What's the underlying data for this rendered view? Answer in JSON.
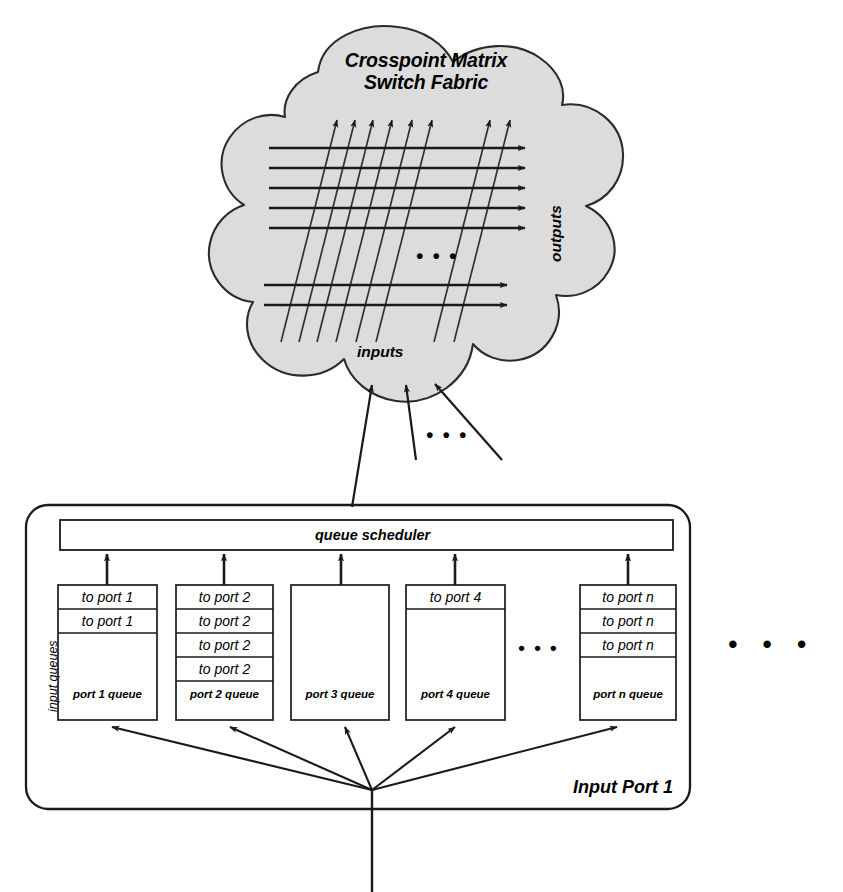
{
  "figure": {
    "kind": "network-switch-architecture-diagram"
  },
  "fabric": {
    "title_line1": "Crosspoint Matrix",
    "title_line2": "Switch Fabric",
    "inputs_label": "inputs",
    "outputs_label": "outputs",
    "matrix_ellipsis": "• • •",
    "input_line_count": 8,
    "output_line_count": 7
  },
  "feed": {
    "ellipsis": "• • •",
    "arrow_count": 3
  },
  "input_port": {
    "box_label": "Input Port 1",
    "scheduler_label": "queue scheduler",
    "side_label": "input queues",
    "inner_ellipsis": "• • •",
    "queues": [
      {
        "name": "port 1 queue",
        "cells": [
          "to port 1",
          "to port 1"
        ]
      },
      {
        "name": "port 2 queue",
        "cells": [
          "to port 2",
          "to port 2",
          "to port 2",
          "to port 2"
        ]
      },
      {
        "name": "port 3 queue",
        "cells": []
      },
      {
        "name": "port 4 queue",
        "cells": [
          "to port 4"
        ]
      },
      {
        "name": "port n queue",
        "cells": [
          "to port n",
          "to port n",
          "to port n"
        ]
      }
    ]
  },
  "outer": {
    "ellipsis": "• • •"
  },
  "colors": {
    "stroke": "#1a1a1a",
    "cloud_fill": "#dcdcdc",
    "page_bg": "#ffffff"
  }
}
